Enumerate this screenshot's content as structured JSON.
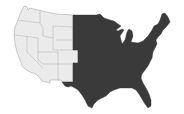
{
  "map": {
    "subject": "Continental United States",
    "regions": [
      {
        "name": "western-states",
        "shade": "light",
        "color": "#ebebeb"
      },
      {
        "name": "eastern-states",
        "shade": "dark",
        "color": "#3a3a3a"
      }
    ],
    "background": "#ffffff",
    "border_color": "#9a9a9a"
  }
}
